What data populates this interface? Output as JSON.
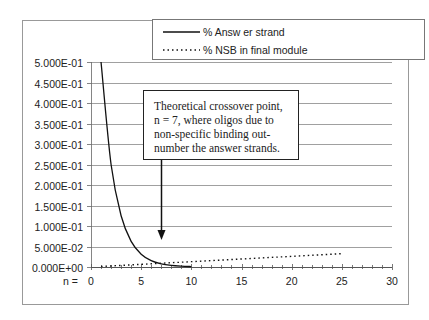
{
  "chart_data": {
    "type": "line",
    "title": "",
    "xlabel": "n =",
    "ylabel": "",
    "xlim": [
      0,
      30
    ],
    "ylim": [
      0,
      0.5
    ],
    "x_ticks": [
      "0",
      "5",
      "10",
      "15",
      "20",
      "25",
      "30"
    ],
    "y_ticks": [
      "0.000E+00",
      "5.000E-02",
      "1.000E-01",
      "1.500E-01",
      "2.000E-01",
      "2.500E-01",
      "3.000E-01",
      "3.500E-01",
      "4.000E-01",
      "4.500E-01",
      "5.000E-01"
    ],
    "grid": true,
    "legend_position": "top",
    "series": [
      {
        "name": "% Answ er strand",
        "style": "solid",
        "x": [
          1,
          2,
          3,
          4,
          5,
          6,
          7,
          8,
          9,
          10
        ],
        "values": [
          0.5,
          0.25,
          0.125,
          0.0625,
          0.03125,
          0.015625,
          0.0078,
          0.0039,
          0.002,
          0.001
        ]
      },
      {
        "name": "% NSB in final module",
        "style": "dotted",
        "x": [
          1,
          2,
          3,
          4,
          5,
          6,
          7,
          8,
          9,
          10,
          11,
          12,
          13,
          14,
          15,
          16,
          17,
          18,
          19,
          20,
          21,
          22,
          23,
          24,
          25
        ],
        "values": [
          0.0013,
          0.0026,
          0.0039,
          0.0052,
          0.0065,
          0.0078,
          0.0091,
          0.0104,
          0.0117,
          0.013,
          0.0143,
          0.0156,
          0.0169,
          0.0182,
          0.0195,
          0.0208,
          0.0221,
          0.0234,
          0.0247,
          0.026,
          0.0273,
          0.0286,
          0.0299,
          0.0312,
          0.0325
        ]
      }
    ],
    "annotations": [
      {
        "text_lines": [
          "Theoretical crossover point,",
          "n = 7, where oligos due to",
          "non-specific binding out-",
          "number the answer strands."
        ],
        "arrow_x": 7
      }
    ]
  }
}
